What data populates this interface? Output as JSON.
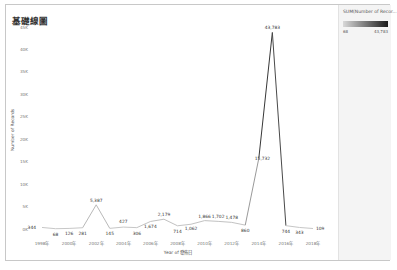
{
  "title": "基礎線圖",
  "legend": {
    "title": "SUM(Number of Recor...",
    "min_label": "68",
    "max_label": "43,783",
    "color_low": "#d9d9d9",
    "color_high": "#1a1a1a"
  },
  "chart_data": {
    "type": "line",
    "title": "基礎線圖",
    "xlabel": "Year of 發佈日",
    "ylabel": "Number of Records",
    "x": [
      1998,
      1999,
      2000,
      2001,
      2002,
      2003,
      2004,
      2005,
      2006,
      2007,
      2008,
      2009,
      2010,
      2011,
      2012,
      2013,
      2014,
      2015,
      2016,
      2017,
      2018
    ],
    "values": [
      344,
      68,
      126,
      281,
      5387,
      145,
      427,
      306,
      1674,
      2179,
      714,
      1062,
      1866,
      1702,
      1478,
      860,
      15732,
      43783,
      744,
      343,
      109
    ],
    "value_labels": [
      "344",
      "68",
      "126",
      "281",
      "5,387",
      "145",
      "427",
      "306",
      "1,674",
      "2,179",
      "714",
      "1,062",
      "1,866",
      "1,702",
      "1,478",
      "860",
      "15,732",
      "43,783",
      "744",
      "343",
      "109"
    ],
    "x_ticks": [
      "1998年",
      "2000年",
      "2002年",
      "2004年",
      "2006年",
      "2008年",
      "2010年",
      "2012年",
      "2014年",
      "2016年",
      "2018年"
    ],
    "y_ticks": [
      "0K",
      "5K",
      "10K",
      "15K",
      "20K",
      "25K",
      "30K",
      "35K",
      "40K",
      "45K"
    ],
    "ylim": [
      0,
      45000
    ],
    "grid": false,
    "legend_position": "right",
    "color_encoding": "SUM(Number of Records)"
  }
}
